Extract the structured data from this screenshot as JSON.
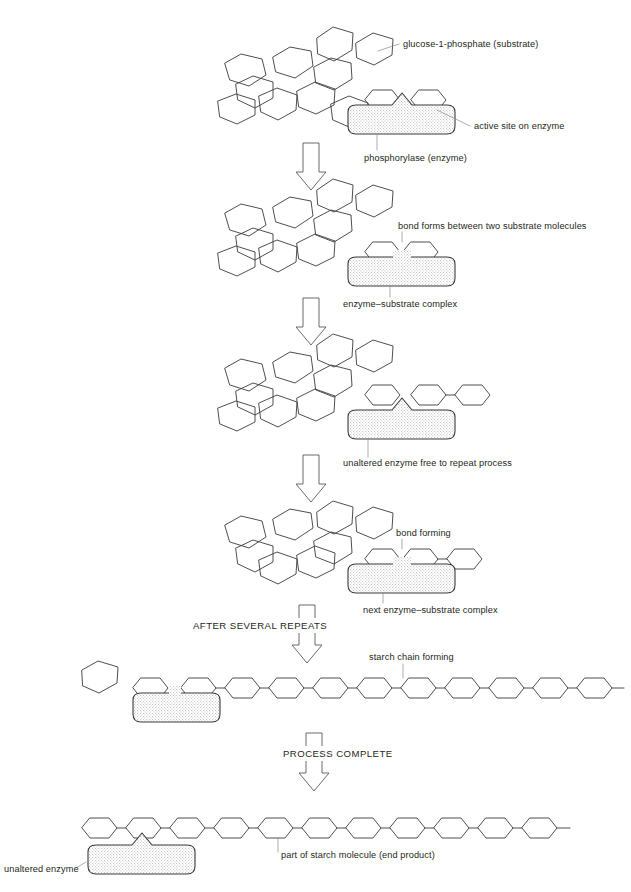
{
  "diagram": {
    "stroke_color": "#3a3a3a",
    "leader_color": "#8a8a8a",
    "text_color": "#231f20"
  },
  "labels": {
    "substrate": "glucose-1-phosphate (substrate)",
    "active_site": "active site on enzyme",
    "enzyme": "phosphorylase (enzyme)",
    "bond_forms": "bond forms between two substrate molecules",
    "es_complex": "enzyme–substrate complex",
    "unaltered_free": "unaltered enzyme free to repeat process",
    "bond_forming": "bond forming",
    "next_es_complex": "next enzyme–substrate complex",
    "after_repeats": "AFTER SEVERAL REPEATS",
    "starch_chain": "starch chain forming",
    "process_complete": "PROCESS COMPLETE",
    "end_product": "part of starch molecule (end product)",
    "unaltered_enzyme": "unaltered enzyme"
  },
  "stages": [
    {
      "id": "stage-1",
      "name": "free substrate and enzyme",
      "free_substrate_count": 10,
      "bound_substrate_count": 2,
      "chain_length": 0,
      "enzyme_present": true
    },
    {
      "id": "stage-2",
      "name": "enzyme-substrate complex",
      "free_substrate_count": 9,
      "bound_substrate_count": 2,
      "chain_length": 0,
      "enzyme_present": true
    },
    {
      "id": "stage-3",
      "name": "unaltered enzyme released",
      "free_substrate_count": 9,
      "bound_substrate_count": 1,
      "chain_length": 2,
      "enzyme_present": true
    },
    {
      "id": "stage-4",
      "name": "next enzyme-substrate complex",
      "free_substrate_count": 8,
      "bound_substrate_count": 2,
      "chain_length": 1,
      "enzyme_present": true
    },
    {
      "id": "stage-5",
      "name": "starch chain forming",
      "free_substrate_count": 1,
      "bound_substrate_count": 2,
      "chain_length": 11,
      "enzyme_present": true
    },
    {
      "id": "stage-6",
      "name": "part of starch molecule end product",
      "free_substrate_count": 0,
      "bound_substrate_count": 0,
      "chain_length": 11,
      "enzyme_present": true
    }
  ],
  "arrows": [
    {
      "id": "arrow-1",
      "between": "stage-1 to stage-2",
      "label": ""
    },
    {
      "id": "arrow-2",
      "between": "stage-2 to stage-3",
      "label": ""
    },
    {
      "id": "arrow-3",
      "between": "stage-3 to stage-4",
      "label": ""
    },
    {
      "id": "arrow-4",
      "between": "stage-4 to stage-5",
      "label": "AFTER SEVERAL REPEATS"
    },
    {
      "id": "arrow-5",
      "between": "stage-5 to stage-6",
      "label": "PROCESS COMPLETE"
    }
  ]
}
